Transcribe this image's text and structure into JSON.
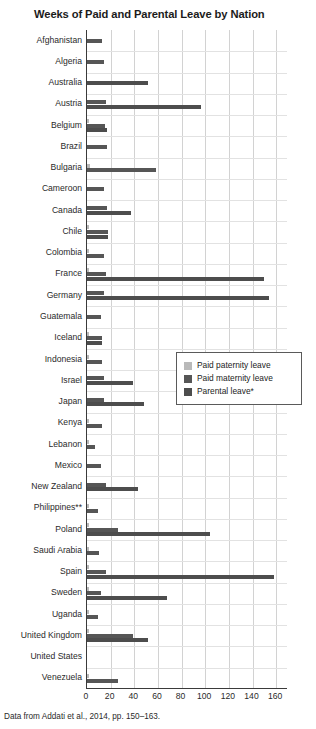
{
  "chart_data": {
    "type": "bar",
    "orientation": "horizontal",
    "title": "Weeks of Paid and Parental Leave by Nation",
    "xlabel": "",
    "ylabel": "",
    "xlim": [
      0,
      170
    ],
    "xticks": [
      0,
      20,
      40,
      60,
      80,
      100,
      120,
      140,
      160
    ],
    "grid": "vertical-and-horizontal",
    "legend_position": "middle-right-inside",
    "source_note": "Data from Addati et al., 2014, pp. 150–163.",
    "legend": [
      {
        "name": "Paid paternity leave",
        "color": "#b9b9b9"
      },
      {
        "name": "Paid maternity leave",
        "color": "#565656"
      },
      {
        "name": "Parental leave*",
        "color": "#4d4d4d"
      }
    ],
    "categories": [
      "Afghanistan",
      "Algeria",
      "Australia",
      "Austria",
      "Belgium",
      "Brazil",
      "Bulgaria",
      "Cameroon",
      "Canada",
      "Chile",
      "Colombia",
      "France",
      "Germany",
      "Guatemala",
      "Iceland",
      "Indonesia",
      "Israel",
      "Japan",
      "Kenya",
      "Lebanon",
      "Mexico",
      "New Zealand",
      "Philippines**",
      "Poland",
      "Saudi Arabia",
      "Spain",
      "Sweden",
      "Uganda",
      "United Kingdom",
      "United States",
      "Venezuela"
    ],
    "series": [
      {
        "name": "Paid paternity leave",
        "color": "#b9b9b9",
        "values": [
          0,
          0,
          0,
          0,
          1.4,
          0,
          2.2,
          0,
          0,
          0.8,
          1.1,
          1.6,
          0,
          0,
          2,
          0.4,
          0,
          0,
          0.4,
          0.2,
          0,
          0,
          1,
          2,
          0.4,
          2.1,
          1.4,
          0.6,
          2,
          0,
          2
        ]
      },
      {
        "name": "Paid maternity leave",
        "color": "#565656",
        "values": [
          13,
          14,
          0,
          16,
          15,
          17,
          58,
          14,
          17,
          18,
          14,
          16,
          14,
          12,
          13,
          13,
          14,
          14,
          13,
          7,
          12,
          16,
          9,
          26,
          10,
          16,
          12,
          9,
          39,
          0,
          26
        ]
      },
      {
        "name": "Parental leave*",
        "color": "#4d4d4d",
        "values": [
          0,
          0,
          52,
          96,
          17,
          0,
          0,
          0,
          37,
          18,
          0,
          150,
          154,
          0,
          13,
          0,
          39,
          48,
          0,
          0,
          0,
          43,
          0,
          104,
          0,
          158,
          68,
          0,
          52,
          0,
          0
        ]
      }
    ]
  }
}
